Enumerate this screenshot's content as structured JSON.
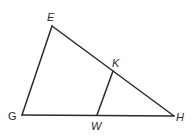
{
  "figure": {
    "type": "triangle-diagram",
    "points": {
      "E": {
        "label": "E",
        "x": 52,
        "y": 26,
        "label_x": 47,
        "label_y": 21,
        "italic": true
      },
      "G": {
        "label": "G",
        "x": 22,
        "y": 115,
        "label_x": 8,
        "label_y": 120,
        "italic": false
      },
      "H": {
        "label": "H",
        "x": 174,
        "y": 116,
        "label_x": 176,
        "label_y": 121,
        "italic": true
      },
      "K": {
        "label": "K",
        "x": 113,
        "y": 71,
        "label_x": 112,
        "label_y": 67,
        "italic": true
      },
      "W": {
        "label": "W",
        "x": 97,
        "y": 115,
        "label_x": 91,
        "label_y": 130,
        "italic": true
      }
    },
    "segments": [
      {
        "from": "E",
        "to": "G"
      },
      {
        "from": "E",
        "to": "H"
      },
      {
        "from": "G",
        "to": "H"
      },
      {
        "from": "K",
        "to": "W"
      }
    ],
    "stroke_color": "#2a2a2a",
    "background": "#ffffff"
  }
}
